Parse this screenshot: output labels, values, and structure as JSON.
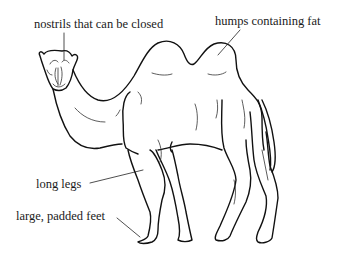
{
  "diagram": {
    "labels": [
      {
        "id": "nostrils",
        "text": "nostrils that can be closed"
      },
      {
        "id": "humps",
        "text": "humps containing fat"
      },
      {
        "id": "legs",
        "text": "long legs"
      },
      {
        "id": "feet",
        "text": "large, padded feet"
      }
    ]
  }
}
